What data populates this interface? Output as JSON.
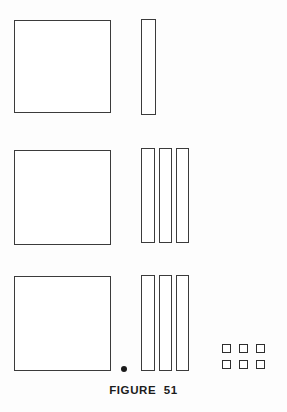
{
  "figure": {
    "caption": "FIGURE  51",
    "caption_top": 384,
    "background_color": "#fdfdfd",
    "stroke_color": "#3b3b3b",
    "fill_color": "#ffffff",
    "canvas": {
      "width": 287,
      "height": 412
    }
  },
  "rows": [
    {
      "name": "row-1",
      "square": {
        "x": 14,
        "y": 20,
        "w": 97,
        "h": 93
      },
      "strips": [
        {
          "x": 141,
          "y": 19,
          "w": 15,
          "h": 96
        }
      ]
    },
    {
      "name": "row-2",
      "square": {
        "x": 14,
        "y": 150,
        "w": 97,
        "h": 95
      },
      "strips": [
        {
          "x": 141,
          "y": 148,
          "w": 14,
          "h": 95
        },
        {
          "x": 159,
          "y": 148,
          "w": 13,
          "h": 95
        },
        {
          "x": 176,
          "y": 148,
          "w": 13,
          "h": 95
        }
      ]
    },
    {
      "name": "row-3",
      "square": {
        "x": 14,
        "y": 276,
        "w": 97,
        "h": 95
      },
      "strips": [
        {
          "x": 141,
          "y": 275,
          "w": 14,
          "h": 96
        },
        {
          "x": 159,
          "y": 275,
          "w": 13,
          "h": 96
        },
        {
          "x": 176,
          "y": 275,
          "w": 13,
          "h": 96
        }
      ]
    }
  ],
  "marker_dot": {
    "x": 121,
    "y": 366,
    "size": 6
  },
  "chip_grid": {
    "name": "small-square-grid",
    "origin_x": 222,
    "origin_y": 344,
    "cell": 9,
    "gap_x": 8,
    "gap_y": 7,
    "cols": 3,
    "rows": 2,
    "count": 6
  }
}
